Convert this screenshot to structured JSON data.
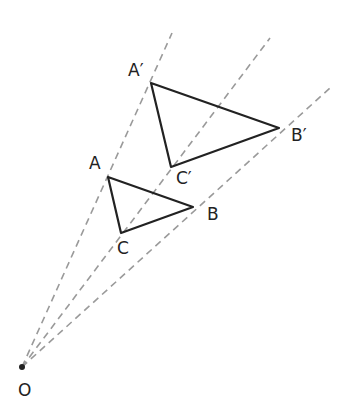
{
  "diagram": {
    "center": {
      "label": "O",
      "x": 22,
      "y": 367
    },
    "original": {
      "A": {
        "label": "A",
        "x": 108,
        "y": 177
      },
      "B": {
        "label": "B",
        "x": 193,
        "y": 207
      },
      "C": {
        "label": "C",
        "x": 121,
        "y": 233
      }
    },
    "image": {
      "A": {
        "label": "A′",
        "x": 151,
        "y": 83
      },
      "B": {
        "label": "B′",
        "x": 279,
        "y": 128
      },
      "C": {
        "label": "C′",
        "x": 171,
        "y": 167
      }
    },
    "rays": [
      {
        "through": "A",
        "end": {
          "x": 172,
          "y": 33
        }
      },
      {
        "through": "C",
        "end": {
          "x": 270,
          "y": 38
        }
      },
      {
        "through": "B",
        "end": {
          "x": 330,
          "y": 88
        }
      }
    ],
    "colors": {
      "lines": "#222222",
      "rays": "#999999"
    }
  }
}
